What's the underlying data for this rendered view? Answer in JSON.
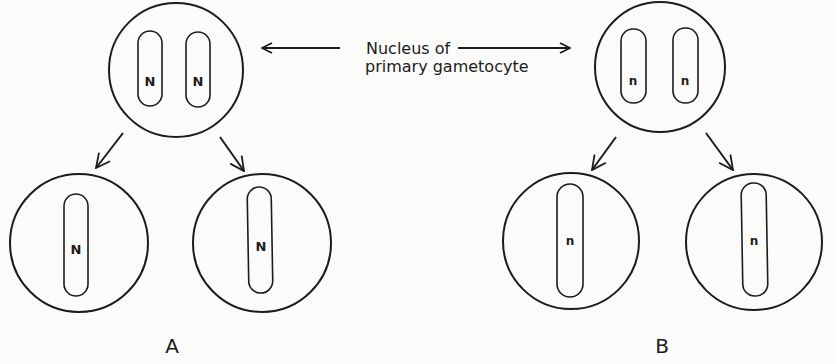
{
  "figure": {
    "caption_line1": "Nucleus of",
    "caption_line2": "primary gametocyte",
    "panels": [
      {
        "label": "A",
        "parent": {
          "chromosomes": [
            "N",
            "N"
          ]
        },
        "children": [
          {
            "chromosomes": [
              "N"
            ]
          },
          {
            "chromosomes": [
              "N"
            ]
          }
        ]
      },
      {
        "label": "B",
        "parent": {
          "chromosomes": [
            "n",
            "n"
          ]
        },
        "children": [
          {
            "chromosomes": [
              "n"
            ]
          },
          {
            "chromosomes": [
              "n"
            ]
          }
        ]
      }
    ]
  },
  "colors": {
    "ink": "#1c1c1c",
    "paper": "#fbfbf9"
  }
}
